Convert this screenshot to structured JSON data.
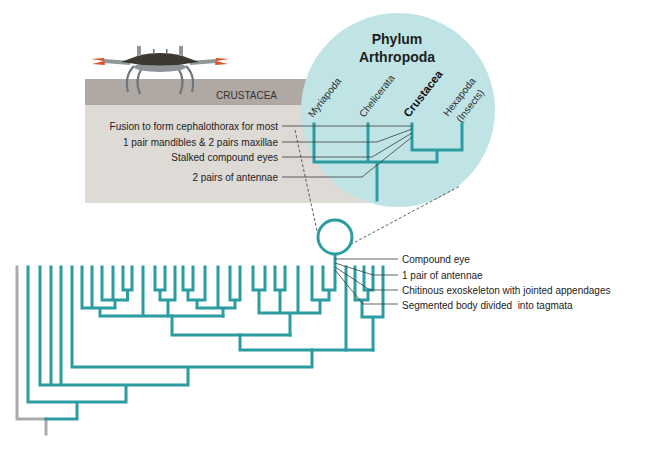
{
  "panel": {
    "group_label": "CRUSTACEA",
    "traits": [
      "Fusion to form cephalothorax for most",
      "1 pair mandibles & 2 pairs maxillae",
      "Stalked compound eyes",
      "2 pairs of antennae"
    ]
  },
  "inset": {
    "title_line1": "Phylum",
    "title_line2": "Arthropoda",
    "clades": [
      {
        "label": "Myriapoda"
      },
      {
        "label": "Chelicerata"
      },
      {
        "label": "Crustacea",
        "emphasized": true
      },
      {
        "label": "Hexapoda",
        "sublabel": "(Insects)"
      }
    ]
  },
  "arthropod_traits": [
    "Compound eye",
    "1 pair of antennae",
    "Chitinous exoskeleton with jointed appendages",
    "Segmented body divided  into tagmata"
  ],
  "icons": {
    "crab": "crab-illustration",
    "inset_marker": "circle-node"
  },
  "colors": {
    "branch": "#2b9ca0",
    "outgroup_branch": "#ababab",
    "inset_fill": "#c0e4e6",
    "band": "#b0a8a3",
    "panel": "#dedad6",
    "crab_claw": "#d9542b"
  }
}
